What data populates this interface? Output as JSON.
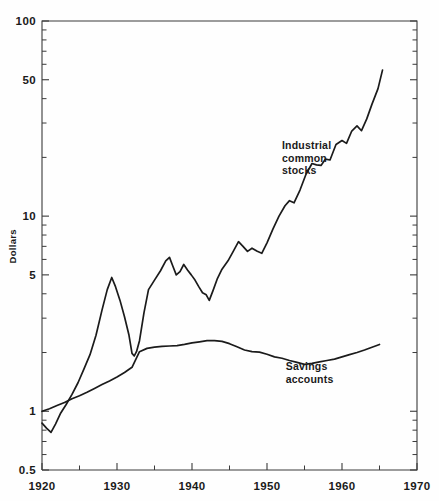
{
  "chart_data": {
    "type": "line",
    "title": "",
    "xlabel": "",
    "ylabel": "Dollars",
    "yscale": "log",
    "ylim": [
      0.5,
      100
    ],
    "xlim": [
      1920,
      1970
    ],
    "grid": false,
    "legend_position": "inline-annotation",
    "y_tick_labels": [
      "0.5",
      "1",
      "5",
      "10",
      "50",
      "100"
    ],
    "y_tick_values": [
      0.5,
      1,
      5,
      10,
      50,
      100
    ],
    "y_minor_values": [
      0.6,
      0.7,
      0.8,
      0.9,
      2,
      3,
      4,
      6,
      7,
      8,
      9,
      20,
      30,
      40,
      60,
      70,
      80,
      90
    ],
    "x_tick_labels": [
      "1920",
      "1930",
      "1940",
      "1950",
      "1960",
      "1970"
    ],
    "x_tick_values": [
      1920,
      1930,
      1940,
      1950,
      1960,
      1970
    ],
    "x_minor_values": [
      1925,
      1935,
      1945,
      1955,
      1965
    ],
    "annotations": [
      {
        "name": "industrial-common-stocks",
        "lines": [
          "Industrial",
          "common",
          "stocks"
        ],
        "x": 1952.0,
        "y": 22.0
      },
      {
        "name": "savings-accounts",
        "lines": [
          "Savings",
          "accounts"
        ],
        "x": 1952.5,
        "y": 1.62
      }
    ],
    "series": [
      {
        "name": "Industrial common stocks",
        "color": "#1b1b1b",
        "x": [
          1920,
          1920.6,
          1921.2,
          1921.8,
          1922.5,
          1923.2,
          1924.0,
          1924.8,
          1925.6,
          1926.4,
          1927.2,
          1928.0,
          1928.7,
          1929.3,
          1929.8,
          1930.4,
          1931.0,
          1931.6,
          1932.0,
          1932.3,
          1932.6,
          1933.0,
          1933.6,
          1934.2,
          1935.0,
          1935.8,
          1936.5,
          1937.0,
          1937.4,
          1937.9,
          1938.4,
          1938.9,
          1939.4,
          1939.9,
          1940.4,
          1940.9,
          1941.4,
          1941.9,
          1942.3,
          1942.8,
          1943.4,
          1944.0,
          1944.8,
          1945.5,
          1946.2,
          1946.8,
          1947.4,
          1948.0,
          1948.7,
          1949.3,
          1950.0,
          1950.8,
          1951.6,
          1952.4,
          1953.0,
          1953.6,
          1954.4,
          1955.2,
          1956.0,
          1956.6,
          1957.2,
          1957.8,
          1958.4,
          1959.2,
          1960.0,
          1960.6,
          1961.3,
          1962.0,
          1962.6,
          1963.3,
          1964.0,
          1964.8,
          1965.4
        ],
        "y": [
          0.87,
          0.82,
          0.78,
          0.86,
          0.98,
          1.08,
          1.22,
          1.4,
          1.65,
          1.95,
          2.45,
          3.3,
          4.2,
          4.85,
          4.35,
          3.7,
          3.05,
          2.45,
          1.98,
          1.92,
          2.02,
          2.3,
          3.2,
          4.2,
          4.7,
          5.25,
          5.9,
          6.15,
          5.6,
          5.0,
          5.2,
          5.65,
          5.3,
          5.0,
          4.7,
          4.35,
          4.05,
          3.95,
          3.7,
          4.15,
          4.8,
          5.35,
          5.9,
          6.6,
          7.4,
          7.0,
          6.6,
          6.85,
          6.6,
          6.45,
          7.3,
          8.6,
          10.0,
          11.3,
          12.0,
          11.7,
          13.6,
          16.4,
          18.6,
          18.3,
          18.2,
          19.6,
          19.4,
          23.3,
          24.4,
          23.6,
          27.3,
          29.0,
          27.4,
          31.5,
          37.5,
          45.0,
          56.0
        ]
      },
      {
        "name": "Savings accounts",
        "color": "#1b1b1b",
        "x": [
          1920,
          1921,
          1922,
          1923,
          1924,
          1925,
          1926,
          1927,
          1928,
          1929,
          1930,
          1931,
          1932,
          1933,
          1934,
          1935,
          1936,
          1937,
          1938,
          1939,
          1940,
          1941,
          1942,
          1943,
          1944,
          1945,
          1946,
          1947,
          1948,
          1949,
          1950,
          1951,
          1952,
          1953,
          1954,
          1955,
          1956,
          1957,
          1958,
          1959,
          1960,
          1961,
          1962,
          1963,
          1964,
          1965
        ],
        "y": [
          1.0,
          1.03,
          1.07,
          1.11,
          1.16,
          1.2,
          1.25,
          1.31,
          1.37,
          1.43,
          1.5,
          1.58,
          1.68,
          2.02,
          2.1,
          2.13,
          2.15,
          2.16,
          2.17,
          2.2,
          2.24,
          2.27,
          2.3,
          2.3,
          2.28,
          2.22,
          2.14,
          2.06,
          2.02,
          2.01,
          1.96,
          1.9,
          1.87,
          1.82,
          1.78,
          1.74,
          1.76,
          1.79,
          1.82,
          1.85,
          1.9,
          1.95,
          2.0,
          2.06,
          2.13,
          2.2
        ]
      }
    ]
  }
}
